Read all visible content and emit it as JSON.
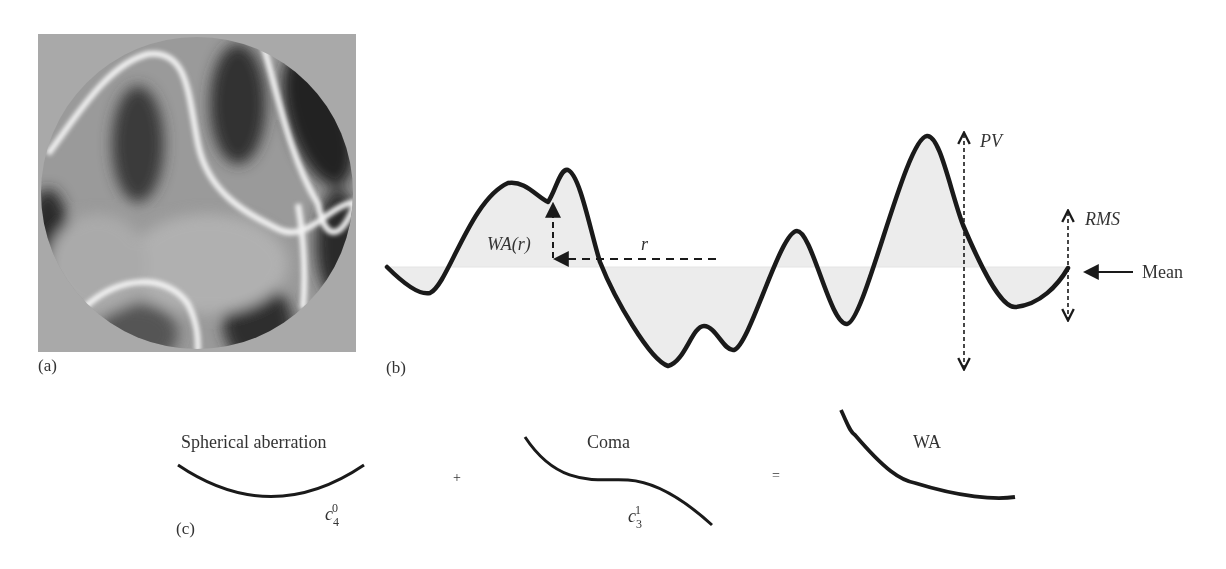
{
  "panels": {
    "a": {
      "label": "(a)",
      "description": "Wavefront aberration map (grayscale interferogram-like pattern in circular pupil)"
    },
    "b": {
      "label": "(b)",
      "annotations": {
        "wa_r": "WA(r)",
        "r": "r",
        "pv": "PV",
        "rms": "RMS",
        "mean": "Mean"
      }
    },
    "c": {
      "label": "(c)",
      "terms": [
        {
          "name": "Spherical aberration",
          "coef_base": "c",
          "coef_sub": "4",
          "coef_sup": "0"
        },
        {
          "name": "Coma",
          "coef_base": "c",
          "coef_sub": "3",
          "coef_sup": "1"
        },
        {
          "name": "WA"
        }
      ],
      "operators": {
        "plus": "+",
        "equals": "="
      }
    }
  },
  "colors": {
    "curve": "#1a1a1a",
    "fill": "#ececec",
    "text": "#333333"
  }
}
